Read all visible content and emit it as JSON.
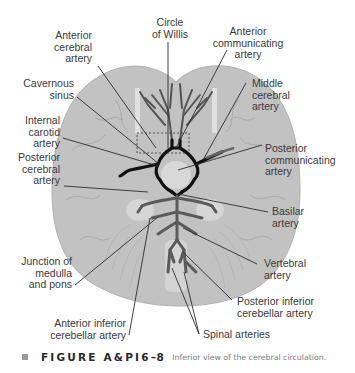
{
  "figure": {
    "title": "Inferior view of the cerebral circulation",
    "colors": {
      "brain_fill": "#c2c2c2",
      "brain_outline": "#b4b4b4",
      "circle_of_willis": "#111111",
      "basilar_vertebral": "#555555",
      "leader_lines": "#2c2c2c",
      "label_text": "#3a3a3a"
    },
    "labels": {
      "circle_of_willis": "Circle\nof Willis",
      "anterior_cerebral": "Anterior\ncerebral\nartery",
      "anterior_communicating": "Anterior\ncommunicating\nartery",
      "cavernous_sinus": "Cavernous\nsinus",
      "middle_cerebral": "Middle\ncerebral\nartery",
      "internal_carotid": "Internal\ncarotid\nartery",
      "posterior_communicating": "Posterior\ncommunicating\nartery",
      "posterior_cerebral": "Posterior\ncerebral\nartery",
      "basilar": "Basilar\nartery",
      "vertebral": "Vertebral\nartery",
      "junction": "Junction of\nmedulla\nand pons",
      "pica": "Posterior inferior\ncerebellar artery",
      "aica": "Anterior inferior\ncerebellar artery",
      "spinal": "Spinal arteries"
    }
  },
  "caption": {
    "figure_number_main": "FIGURE A&PI6",
    "figure_number_tail": "–8",
    "text": "Inferior view of the cerebral circulation."
  }
}
